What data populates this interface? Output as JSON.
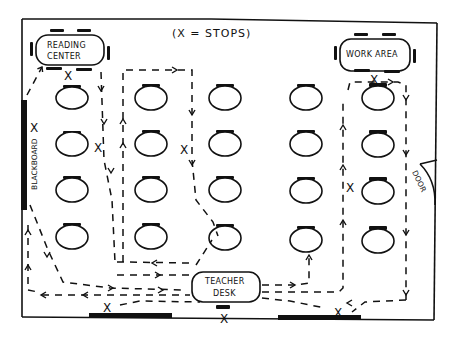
{
  "diagram": {
    "title": "(X = STOPS)",
    "zones": {
      "reading_center": {
        "line1": "READING",
        "line2": "CENTER"
      },
      "work_area": {
        "label": "WORK AREA"
      },
      "teacher_desk": {
        "line1": "TEACHER",
        "line2": "DESK"
      },
      "blackboard": {
        "label": "BLACKBOARD"
      },
      "door": {
        "label": "DOOR"
      }
    },
    "stop_marker": "X",
    "student_desks": {
      "columns": 5,
      "rows": 4,
      "count": 20
    },
    "colors": {
      "ink": "#111111",
      "paper": "#ffffff"
    }
  }
}
